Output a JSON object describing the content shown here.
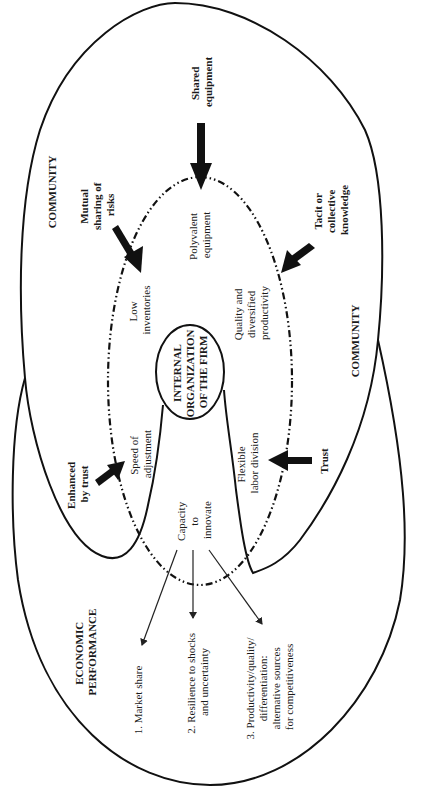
{
  "diagram": {
    "center": {
      "line1": "INTERNAL",
      "line2": "ORGANIZATION",
      "line3": "OF THE FIRM"
    },
    "regions": {
      "community_left": "COMMUNITY",
      "community_right": "COMMUNITY",
      "economic_performance_line1": "ECONOMIC",
      "economic_performance_line2": "PERFORMANCE"
    },
    "community_inputs": [
      {
        "id": "shared-equipment",
        "lines": [
          "Shared",
          "equipment"
        ]
      },
      {
        "id": "mutual-sharing-of-risks",
        "lines": [
          "Mutual",
          "sharing of",
          "risks"
        ]
      },
      {
        "id": "tacit-or-collective-knowledge",
        "lines": [
          "Tacit or",
          "collective",
          "knowledge"
        ]
      },
      {
        "id": "enhanced-by-trust",
        "lines": [
          "Enhanced",
          "by trust"
        ]
      },
      {
        "id": "trust",
        "lines": [
          "Trust"
        ]
      }
    ],
    "firm_attributes": [
      {
        "id": "polyvalent-equipment",
        "lines": [
          "Polyvalent",
          "equipment"
        ]
      },
      {
        "id": "low-inventories",
        "lines": [
          "Low",
          "inventories"
        ]
      },
      {
        "id": "quality-diversified-productivity",
        "lines": [
          "Quality and",
          "diversified",
          "productivity"
        ]
      },
      {
        "id": "speed-of-adjustment",
        "lines": [
          "Speed of",
          "adjustment"
        ]
      },
      {
        "id": "flexible-labor-division",
        "lines": [
          "Flexible",
          "labor division"
        ]
      },
      {
        "id": "capacity-to-innovate",
        "lines": [
          "Capacity",
          "to",
          "innovate"
        ]
      }
    ],
    "outcomes": [
      {
        "id": "market-share",
        "lines": [
          "1. Market share"
        ]
      },
      {
        "id": "resilience",
        "lines": [
          "2. Resilience  to shocks",
          "and uncertainty"
        ]
      },
      {
        "id": "productivity-quality",
        "lines": [
          "3. Productivity/quality/",
          "differentiation:",
          "alternative sources",
          "for competitiveness"
        ]
      }
    ]
  }
}
